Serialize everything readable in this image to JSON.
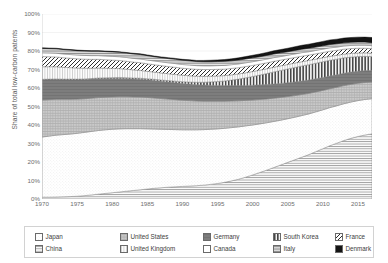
{
  "chart_data": {
    "type": "area",
    "title": "",
    "subtitle": "",
    "xlabel": "",
    "ylabel": "Share of total low-carbon patents",
    "xlim": [
      1970,
      2017
    ],
    "ylim": [
      0,
      1
    ],
    "grid": true,
    "stacked": true,
    "stack_order_bottom_to_top": [
      "China",
      "Japan",
      "United States",
      "Germany",
      "South Korea",
      "United Kingdom",
      "France",
      "Canada",
      "Italy",
      "Denmark"
    ],
    "legend_position": "bottom",
    "y_tick_labels": [
      "0%",
      "10%",
      "20%",
      "30%",
      "40%",
      "50%",
      "60%",
      "70%",
      "80%",
      "90%",
      "100%"
    ],
    "y_tick_values": [
      0,
      10,
      20,
      30,
      40,
      50,
      60,
      70,
      80,
      90,
      100
    ],
    "x_tick_labels": [
      "1970",
      "1975",
      "1980",
      "1985",
      "1990",
      "1995",
      "2000",
      "2005",
      "2010",
      "2015"
    ],
    "x_tick_values": [
      1970,
      1975,
      1980,
      1985,
      1990,
      1995,
      2000,
      2005,
      2010,
      2015
    ],
    "x": [
      1970,
      1971,
      1972,
      1973,
      1974,
      1975,
      1976,
      1977,
      1978,
      1979,
      1980,
      1981,
      1982,
      1983,
      1984,
      1985,
      1986,
      1987,
      1988,
      1989,
      1990,
      1991,
      1992,
      1993,
      1994,
      1995,
      1996,
      1997,
      1998,
      1999,
      2000,
      2001,
      2002,
      2003,
      2004,
      2005,
      2006,
      2007,
      2008,
      2009,
      2010,
      2011,
      2012,
      2013,
      2014,
      2015,
      2016,
      2017
    ],
    "series": [
      {
        "name": "China",
        "pattern": "horizontal-lines",
        "color": "#e8e8e8",
        "values": [
          1.0,
          1.0,
          1.1,
          1.2,
          1.3,
          1.5,
          1.8,
          2.2,
          2.6,
          3.0,
          3.4,
          3.8,
          4.2,
          4.6,
          5.0,
          5.4,
          5.8,
          6.1,
          6.4,
          6.6,
          6.8,
          7.0,
          7.2,
          7.5,
          7.9,
          8.4,
          9.0,
          9.8,
          10.7,
          11.8,
          13.0,
          14.3,
          15.6,
          17.0,
          18.4,
          19.8,
          21.2,
          22.6,
          24.0,
          25.6,
          27.2,
          28.8,
          30.2,
          31.6,
          32.8,
          33.8,
          34.6,
          35.2
        ]
      },
      {
        "name": "Japan",
        "pattern": "fine-dots",
        "color": "#fdfdfd",
        "values": [
          32.5,
          33.0,
          33.4,
          33.6,
          33.8,
          34.0,
          34.2,
          34.3,
          34.4,
          34.4,
          34.3,
          34.1,
          33.8,
          33.4,
          33.0,
          32.5,
          32.0,
          31.6,
          31.2,
          30.9,
          30.6,
          30.4,
          30.2,
          30.0,
          29.8,
          29.5,
          29.2,
          28.8,
          28.3,
          27.7,
          27.0,
          26.3,
          25.6,
          24.9,
          24.2,
          23.6,
          23.0,
          22.5,
          22.0,
          21.5,
          21.0,
          20.6,
          20.2,
          19.9,
          19.6,
          19.4,
          19.2,
          19.0
        ]
      },
      {
        "name": "United States",
        "pattern": "crosshatch-grey",
        "color": "#bdbdbd",
        "values": [
          20.0,
          19.7,
          19.4,
          19.1,
          18.8,
          18.5,
          18.2,
          18.0,
          17.8,
          17.6,
          17.5,
          17.4,
          17.3,
          17.2,
          17.1,
          17.0,
          16.8,
          16.6,
          16.4,
          16.2,
          16.0,
          15.8,
          15.6,
          15.4,
          15.2,
          15.0,
          14.7,
          14.4,
          14.1,
          13.8,
          13.5,
          13.2,
          12.9,
          12.6,
          12.3,
          12.0,
          11.7,
          11.4,
          11.1,
          10.8,
          10.5,
          10.2,
          10.0,
          9.8,
          9.6,
          9.4,
          9.2,
          9.0
        ]
      },
      {
        "name": "Germany",
        "pattern": "solid-dark-grey",
        "color": "#7d7d7d",
        "values": [
          11.0,
          10.9,
          10.8,
          10.7,
          10.6,
          10.5,
          10.4,
          10.3,
          10.2,
          10.1,
          10.0,
          9.9,
          9.8,
          9.7,
          9.6,
          9.5,
          9.4,
          9.3,
          9.2,
          9.1,
          9.0,
          8.9,
          8.8,
          8.7,
          8.6,
          8.5,
          8.4,
          8.3,
          8.2,
          8.1,
          8.0,
          7.9,
          7.8,
          7.7,
          7.6,
          7.5,
          7.4,
          7.3,
          7.2,
          7.1,
          7.0,
          6.9,
          6.8,
          6.7,
          6.6,
          6.5,
          6.4,
          6.3
        ]
      },
      {
        "name": "South Korea",
        "pattern": "vertical-bars",
        "color": "#5e5e5e",
        "values": [
          0.2,
          0.2,
          0.2,
          0.2,
          0.3,
          0.3,
          0.3,
          0.3,
          0.4,
          0.4,
          0.4,
          0.5,
          0.5,
          0.5,
          0.6,
          0.6,
          0.7,
          0.7,
          0.8,
          0.9,
          1.0,
          1.1,
          1.3,
          1.5,
          1.8,
          2.1,
          2.5,
          3.0,
          3.5,
          4.1,
          4.7,
          5.3,
          5.9,
          6.5,
          7.0,
          7.4,
          7.8,
          8.1,
          8.3,
          8.4,
          8.5,
          8.5,
          8.4,
          8.3,
          8.1,
          7.9,
          7.7,
          7.5
        ]
      },
      {
        "name": "United Kingdom",
        "pattern": "vertical-lines-light",
        "color": "#f0f0f0",
        "values": [
          6.8,
          6.7,
          6.6,
          6.4,
          6.2,
          6.0,
          5.8,
          5.6,
          5.4,
          5.2,
          5.0,
          4.8,
          4.6,
          4.4,
          4.2,
          4.0,
          3.9,
          3.8,
          3.7,
          3.6,
          3.5,
          3.4,
          3.3,
          3.2,
          3.1,
          3.0,
          2.9,
          2.8,
          2.8,
          2.7,
          2.7,
          2.6,
          2.6,
          2.5,
          2.5,
          2.4,
          2.4,
          2.3,
          2.3,
          2.2,
          2.2,
          2.1,
          2.1,
          2.0,
          2.0,
          1.9,
          1.9,
          1.8
        ]
      },
      {
        "name": "France",
        "pattern": "diagonal-hatch",
        "color": "#cfcfcf",
        "values": [
          5.5,
          5.4,
          5.3,
          5.2,
          5.1,
          5.0,
          4.9,
          4.8,
          4.7,
          4.6,
          4.5,
          4.4,
          4.3,
          4.2,
          4.2,
          4.1,
          4.0,
          4.0,
          3.9,
          3.9,
          3.8,
          3.8,
          3.7,
          3.7,
          3.6,
          3.6,
          3.5,
          3.5,
          3.4,
          3.4,
          3.3,
          3.3,
          3.2,
          3.2,
          3.1,
          3.1,
          3.0,
          3.0,
          2.9,
          2.9,
          2.8,
          2.8,
          2.7,
          2.7,
          2.6,
          2.6,
          2.5,
          2.5
        ]
      },
      {
        "name": "Canada",
        "pattern": "blank-white",
        "color": "#ffffff",
        "values": [
          2.0,
          2.0,
          2.0,
          2.0,
          2.0,
          2.0,
          2.0,
          2.0,
          2.0,
          2.0,
          2.0,
          2.0,
          2.0,
          2.0,
          2.0,
          2.0,
          2.0,
          2.0,
          2.0,
          2.0,
          2.0,
          2.0,
          2.0,
          2.0,
          2.0,
          2.0,
          2.0,
          2.0,
          2.0,
          2.0,
          2.0,
          2.0,
          2.0,
          2.0,
          1.9,
          1.9,
          1.9,
          1.9,
          1.8,
          1.8,
          1.8,
          1.8,
          1.7,
          1.7,
          1.7,
          1.6,
          1.6,
          1.6
        ]
      },
      {
        "name": "Italy",
        "pattern": "dense-horizontal",
        "color": "#a8a8a8",
        "values": [
          2.4,
          2.4,
          2.4,
          2.4,
          2.4,
          2.4,
          2.4,
          2.4,
          2.4,
          2.4,
          2.4,
          2.4,
          2.4,
          2.4,
          2.4,
          2.4,
          2.3,
          2.3,
          2.3,
          2.3,
          2.3,
          2.3,
          2.2,
          2.2,
          2.2,
          2.2,
          2.2,
          2.1,
          2.1,
          2.1,
          2.1,
          2.0,
          2.0,
          2.0,
          2.0,
          1.9,
          1.9,
          1.9,
          1.9,
          1.8,
          1.8,
          1.8,
          1.8,
          1.7,
          1.7,
          1.7,
          1.7,
          1.6
        ]
      },
      {
        "name": "Denmark",
        "pattern": "solid-black",
        "color": "#141414",
        "values": [
          0.3,
          0.3,
          0.3,
          0.3,
          0.3,
          0.3,
          0.3,
          0.3,
          0.3,
          0.3,
          0.3,
          0.3,
          0.3,
          0.4,
          0.4,
          0.4,
          0.4,
          0.4,
          0.5,
          0.5,
          0.5,
          0.6,
          0.6,
          0.7,
          0.8,
          0.9,
          1.0,
          1.1,
          1.2,
          1.3,
          1.4,
          1.5,
          1.6,
          1.7,
          1.8,
          1.9,
          2.0,
          2.1,
          2.2,
          2.3,
          2.4,
          2.5,
          2.5,
          2.6,
          2.6,
          2.7,
          2.7,
          2.8
        ]
      }
    ]
  },
  "legend": {
    "rows": [
      [
        {
          "label": "Japan",
          "series": "Japan"
        },
        {
          "label": "United States",
          "series": "United States"
        },
        {
          "label": "Germany",
          "series": "Germany"
        },
        {
          "label": "South Korea",
          "series": "South Korea"
        },
        {
          "label": "France",
          "series": "France"
        }
      ],
      [
        {
          "label": "China",
          "series": "China"
        },
        {
          "label": "United Kingdom",
          "series": "United Kingdom"
        },
        {
          "label": "Canada",
          "series": "Canada"
        },
        {
          "label": "Italy",
          "series": "Italy"
        },
        {
          "label": "Denmark",
          "series": "Denmark"
        }
      ]
    ]
  }
}
